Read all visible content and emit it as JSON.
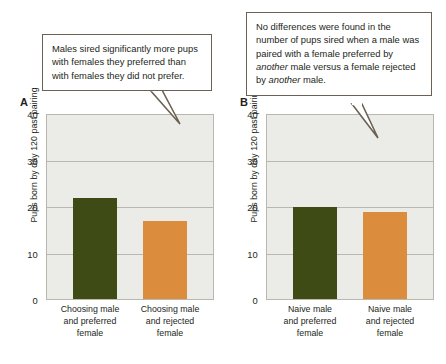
{
  "callouts": {
    "left": {
      "name": "callout-panel-a",
      "text": "Males sired significantly more pups with females they preferred than with females they did not prefer."
    },
    "right": {
      "name": "callout-panel-b",
      "segments": [
        {
          "text": "No differences were found in the number of pups sired when a male was paired with a female preferred by ",
          "italic": false
        },
        {
          "text": "another",
          "italic": true
        },
        {
          "text": " male versus a female rejected by ",
          "italic": false
        },
        {
          "text": "another",
          "italic": true
        },
        {
          "text": " male.",
          "italic": false
        }
      ]
    }
  },
  "colors": {
    "bar_green": "#3f4b15",
    "bar_orange": "#db8c3c",
    "plot_background": "#ebebe8",
    "gridline": "#b9b7b0",
    "callout_border": "#6b6152",
    "text": "#231f20"
  },
  "chart_data": [
    {
      "panel": "A",
      "type": "bar",
      "title": "",
      "xlabel": "",
      "ylabel": "Pups born by day 120 past pairing",
      "ylim": [
        0,
        40
      ],
      "yticks": [
        "0",
        "10",
        "20",
        "30",
        "40"
      ],
      "ytick_values": [
        0,
        10,
        20,
        30,
        40
      ],
      "grid": true,
      "legend": "none",
      "categories": [
        "Choosing male and preferred female",
        "Choosing male and rejected female"
      ],
      "category_lines": [
        [
          "Choosing male",
          "and preferred",
          "female"
        ],
        [
          "Choosing male",
          "and rejected",
          "female"
        ]
      ],
      "values": [
        22,
        17
      ],
      "bar_colors": [
        "#3f4b15",
        "#db8c3c"
      ]
    },
    {
      "panel": "B",
      "type": "bar",
      "title": "",
      "xlabel": "",
      "ylabel": "Pups born by day 120 past pairing",
      "ylim": [
        0,
        40
      ],
      "yticks": [
        "0",
        "10",
        "20",
        "30",
        "40"
      ],
      "ytick_values": [
        0,
        10,
        20,
        30,
        40
      ],
      "grid": true,
      "legend": "none",
      "categories": [
        "Naive male and preferred female",
        "Naive male and rejected female"
      ],
      "category_lines": [
        [
          "Naive male",
          "and preferred",
          "female"
        ],
        [
          "Naive male",
          "and rejected",
          "female"
        ]
      ],
      "values": [
        20,
        19
      ],
      "bar_colors": [
        "#3f4b15",
        "#db8c3c"
      ]
    }
  ],
  "panels": {
    "a": {
      "letter": "A"
    },
    "b": {
      "letter": "B"
    }
  }
}
